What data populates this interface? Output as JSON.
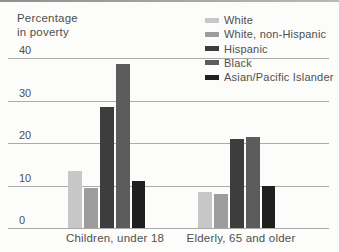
{
  "chart_data": {
    "type": "bar",
    "title": "Percentage in poverty",
    "title_lines": [
      "Percentage",
      "in poverty"
    ],
    "categories": [
      "Children, under 18",
      "Elderly, 65 and older"
    ],
    "series": [
      {
        "name": "White",
        "color": "#c7c7c7",
        "values": [
          13.5,
          8.5
        ]
      },
      {
        "name": "White, non-Hispanic",
        "color": "#9c9c9c",
        "values": [
          9.5,
          8
        ]
      },
      {
        "name": "Hispanic",
        "color": "#3d3d3d",
        "values": [
          28.5,
          21
        ]
      },
      {
        "name": "Black",
        "color": "#5c5c5c",
        "values": [
          38.5,
          21.5
        ]
      },
      {
        "name": "Asian/Pacific Islander",
        "color": "#1f1f1f",
        "values": [
          11,
          10
        ]
      }
    ],
    "yticks": [
      "40",
      "30",
      "20",
      "10",
      "0"
    ],
    "ylim": [
      0,
      40
    ],
    "grid": "horizontal",
    "legend_position": "top-right"
  },
  "colors": {
    "background": "#fcfcfa",
    "gridline": "#ababab",
    "text": "#4f4f4f",
    "top_rule": "#9a9a9a"
  }
}
